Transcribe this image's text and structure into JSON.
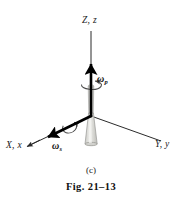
{
  "figure": {
    "type": "mechanics-diagram",
    "background_color": "#ffffff",
    "line_color": "#2b2b2b",
    "vector_color": "#000000",
    "body_fill": "#d8d8d4",
    "body_stroke": "#9a9a96",
    "axes": [
      {
        "name": "vertical-axis",
        "label": "Z, z",
        "direction": "up"
      },
      {
        "name": "x-axis",
        "label": "X, x",
        "direction": "lower-left"
      },
      {
        "name": "y-axis",
        "label": "Y, y",
        "direction": "lower-right"
      }
    ],
    "vectors": [
      {
        "name": "precession-vector",
        "symbol": "ω",
        "subscript": "p",
        "along": "Z"
      },
      {
        "name": "spin-vector",
        "symbol": "ω",
        "subscript": "s",
        "along": "X"
      }
    ],
    "caption": {
      "part": "(c)",
      "figure_number": "Fig. 21–13"
    }
  }
}
